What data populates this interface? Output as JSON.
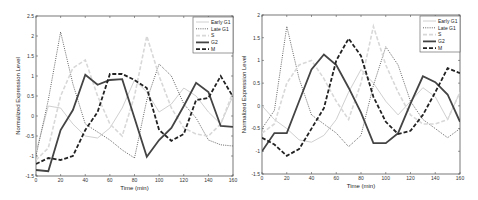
{
  "chart_data": [
    {
      "type": "line",
      "title": "",
      "xlabel": "Time (min)",
      "ylabel": "Normalized Expression Level",
      "xlim": [
        0,
        160
      ],
      "ylim": [
        -1.5,
        2.5
      ],
      "xticks": [
        0,
        20,
        40,
        60,
        80,
        100,
        120,
        140,
        160
      ],
      "yticks": [
        -1.5,
        -1,
        -0.5,
        0,
        0.5,
        1,
        1.5,
        2,
        2.5
      ],
      "grid": false,
      "legend_position": "upper right",
      "x": [
        0,
        10,
        20,
        30,
        40,
        50,
        60,
        70,
        80,
        90,
        100,
        110,
        120,
        130,
        140,
        150,
        160
      ],
      "series": [
        {
          "name": "Early G1",
          "style": "thin-solid-light",
          "color": "#d0d0d0",
          "values": [
            -0.9,
            0.25,
            0.2,
            -0.2,
            -0.5,
            -0.55,
            -0.3,
            0.2,
            0.9,
            0.6,
            0.1,
            0.3,
            0.7,
            0.5,
            0.1,
            -0.2,
            0.5
          ]
        },
        {
          "name": "Late G1",
          "style": "dotted",
          "color": "#666666",
          "values": [
            -1.0,
            0.4,
            2.1,
            0.8,
            -0.2,
            -0.4,
            -0.6,
            -0.85,
            -1.05,
            0.4,
            1.3,
            1.0,
            0.3,
            -0.05,
            -0.6,
            -0.72,
            -0.75
          ]
        },
        {
          "name": "S",
          "style": "dashed-light",
          "color": "#d8d8d8",
          "values": [
            -1.1,
            -0.8,
            0.5,
            1.2,
            1.4,
            0.5,
            -0.2,
            -0.5,
            0.5,
            2.0,
            1.0,
            0.2,
            -0.3,
            -0.45,
            -0.5,
            -0.2,
            0.6
          ]
        },
        {
          "name": "G2",
          "style": "thick-solid",
          "color": "#444444",
          "values": [
            -1.35,
            -1.38,
            -0.35,
            0.15,
            1.03,
            0.78,
            0.9,
            0.92,
            -0.05,
            -1.02,
            -0.6,
            -0.3,
            0.25,
            0.83,
            0.6,
            -0.25,
            -0.27
          ]
        },
        {
          "name": "M",
          "style": "thick-dashed",
          "color": "#222222",
          "values": [
            -1.2,
            -1.05,
            -1.1,
            -1.0,
            -0.35,
            0.1,
            1.05,
            1.05,
            0.9,
            0.7,
            -0.35,
            -0.62,
            -0.45,
            0.4,
            0.45,
            1.0,
            0.48
          ]
        }
      ]
    },
    {
      "type": "line",
      "title": "",
      "xlabel": "Time (min)",
      "ylabel": "Normalized Expression Level",
      "xlim": [
        0,
        160
      ],
      "ylim": [
        -1.5,
        2
      ],
      "xticks": [
        0,
        20,
        40,
        60,
        80,
        100,
        120,
        140,
        160
      ],
      "yticks": [
        -1.5,
        -1,
        -0.5,
        0,
        0.5,
        1,
        1.5,
        2
      ],
      "grid": false,
      "legend_position": "upper right",
      "x": [
        0,
        10,
        20,
        30,
        40,
        50,
        60,
        70,
        80,
        90,
        100,
        110,
        120,
        130,
        140,
        150,
        160
      ],
      "series": [
        {
          "name": "Early G1",
          "style": "thin-solid-light",
          "color": "#d0d0d0",
          "values": [
            0.0,
            -0.3,
            -0.5,
            -0.75,
            -0.8,
            -0.65,
            -0.3,
            0.3,
            0.8,
            0.5,
            0.1,
            -0.2,
            0.1,
            0.4,
            0.2,
            -0.3,
            0.3
          ]
        },
        {
          "name": "Late G1",
          "style": "dotted",
          "color": "#666666",
          "values": [
            -0.5,
            -0.1,
            1.75,
            0.6,
            -0.2,
            -0.4,
            -0.6,
            -0.9,
            -0.65,
            0.45,
            1.3,
            0.9,
            0.1,
            -0.3,
            -0.5,
            -0.7,
            -0.5
          ]
        },
        {
          "name": "S",
          "style": "dashed-light",
          "color": "#d8d8d8",
          "values": [
            -0.6,
            -0.4,
            0.5,
            0.9,
            1.0,
            0.6,
            0.1,
            -0.3,
            0.5,
            1.75,
            0.9,
            0.3,
            -0.2,
            -0.4,
            -0.4,
            -0.3,
            0.3
          ]
        },
        {
          "name": "G2",
          "style": "thick-solid",
          "color": "#444444",
          "values": [
            -1.0,
            -0.6,
            -0.6,
            0.1,
            0.8,
            1.13,
            0.9,
            0.4,
            -0.15,
            -0.82,
            -0.82,
            -0.6,
            0.05,
            0.65,
            0.52,
            0.25,
            -0.35
          ]
        },
        {
          "name": "M",
          "style": "thick-dashed",
          "color": "#222222",
          "values": [
            -0.7,
            -0.85,
            -1.1,
            -0.95,
            -0.5,
            -0.05,
            1.0,
            1.48,
            1.1,
            0.2,
            -0.35,
            -0.62,
            -0.55,
            -0.2,
            0.3,
            0.83,
            0.72
          ]
        }
      ]
    }
  ],
  "layout": {
    "plots": [
      {
        "left": 36,
        "top": 16,
        "right": 233,
        "bottom": 176,
        "legend": {
          "x": 193,
          "y": 17,
          "w": 40,
          "h": 36
        }
      },
      {
        "left": 23,
        "top": 15,
        "right": 221,
        "bottom": 174,
        "legend": {
          "x": 181,
          "y": 16,
          "w": 40,
          "h": 36
        }
      }
    ]
  }
}
